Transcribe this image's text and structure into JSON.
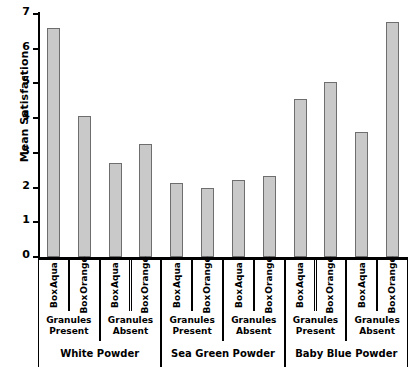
{
  "chart_data": {
    "type": "bar",
    "title": "",
    "xlabel": "",
    "ylabel": "Mean Satisfaction",
    "ylim": [
      0,
      7
    ],
    "yticks": [
      0,
      1,
      2,
      3,
      4,
      5,
      6,
      7
    ],
    "grid": false,
    "legend": "none",
    "bar_color": "#c9c9c9",
    "bar_edge_color": "#6e6e6e",
    "categories": [
      "Aqua Box",
      "Orange Box",
      "Aqua Box",
      "Orange Box",
      "Aqua Box",
      "Orange Box",
      "Aqua Box",
      "Orange Box",
      "Aqua Box",
      "Orange Box",
      "Aqua Box",
      "Orange Box"
    ],
    "values": [
      6.6,
      4.05,
      2.7,
      3.25,
      2.13,
      2.0,
      2.22,
      2.33,
      4.55,
      5.05,
      3.6,
      6.78
    ],
    "group_level_2": [
      "Granules Present",
      "Granules Absent",
      "Granules Present",
      "Granules Absent",
      "Granules Present",
      "Granules Absent"
    ],
    "group_level_3": [
      "White Powder",
      "Sea Green Powder",
      "Baby Blue Powder"
    ],
    "bars": [
      {
        "box": "Aqua Box",
        "granules": "Granules Present",
        "powder": "White Powder",
        "value": 6.6
      },
      {
        "box": "Orange Box",
        "granules": "Granules Present",
        "powder": "White Powder",
        "value": 4.05
      },
      {
        "box": "Aqua Box",
        "granules": "Granules Absent",
        "powder": "White Powder",
        "value": 2.7
      },
      {
        "box": "Orange Box",
        "granules": "Granules Absent",
        "powder": "White Powder",
        "value": 3.25
      },
      {
        "box": "Aqua Box",
        "granules": "Granules Present",
        "powder": "Sea Green Powder",
        "value": 2.13
      },
      {
        "box": "Orange Box",
        "granules": "Granules Present",
        "powder": "Sea Green Powder",
        "value": 2.0
      },
      {
        "box": "Aqua Box",
        "granules": "Granules Absent",
        "powder": "Sea Green Powder",
        "value": 2.22
      },
      {
        "box": "Orange Box",
        "granules": "Granules Absent",
        "powder": "Sea Green Powder",
        "value": 2.33
      },
      {
        "box": "Aqua Box",
        "granules": "Granules Present",
        "powder": "Baby Blue Powder",
        "value": 4.55
      },
      {
        "box": "Orange Box",
        "granules": "Granules Present",
        "powder": "Baby Blue Powder",
        "value": 5.05
      },
      {
        "box": "Aqua Box",
        "granules": "Granules Absent",
        "powder": "Baby Blue Powder",
        "value": 3.6
      },
      {
        "box": "Orange Box",
        "granules": "Granules Absent",
        "powder": "Baby Blue Powder",
        "value": 6.78
      }
    ]
  }
}
